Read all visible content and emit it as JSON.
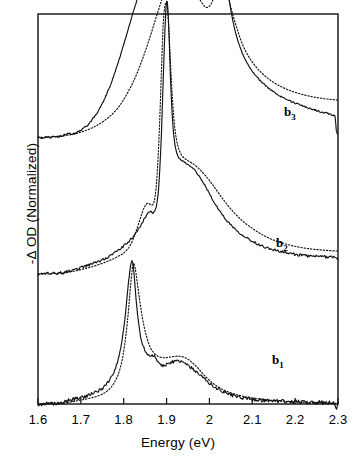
{
  "figure": {
    "axis_label_x": "Energy (eV)",
    "axis_label_y": "-Δ OD (Normalized)",
    "frame": {
      "left": 38,
      "right": 338,
      "top": 14,
      "bottom": 404
    }
  },
  "trace_labels": [
    {
      "name": "b1",
      "base": "b",
      "sub": "1",
      "x": 272,
      "y": 352
    },
    {
      "name": "b2",
      "base": "b",
      "sub": "2",
      "x": 276,
      "y": 235
    },
    {
      "name": "b3",
      "base": "b",
      "sub": "3",
      "x": 284,
      "y": 104
    }
  ],
  "chart_data": {
    "type": "line",
    "title": "",
    "xlabel": "Energy (eV)",
    "ylabel": "-Δ OD (Normalized)",
    "xlim": [
      1.6,
      2.3
    ],
    "ylim": [
      0,
      3
    ],
    "grid": false,
    "legend": null,
    "xticks": [
      1.6,
      1.7,
      1.8,
      1.9,
      2.0,
      2.1,
      2.2,
      2.3
    ],
    "xtick_labels": [
      "1.6",
      "1.7",
      "1.8",
      "1.9",
      "2",
      "2.1",
      "2.2",
      "2.3"
    ],
    "yticks": [],
    "ytick_labels": [],
    "offsets": {
      "b1": 0.0,
      "b2": 1.0,
      "b3": 2.05
    },
    "series": [
      {
        "name": "b1 experimental",
        "label": "b1",
        "style": "solid",
        "noise": 0.012,
        "x": [
          1.6,
          1.62,
          1.64,
          1.655,
          1.665,
          1.675,
          1.685,
          1.695,
          1.705,
          1.715,
          1.725,
          1.735,
          1.745,
          1.755,
          1.765,
          1.775,
          1.785,
          1.793,
          1.8,
          1.806,
          1.811,
          1.815,
          1.818,
          1.82,
          1.822,
          1.825,
          1.829,
          1.834,
          1.84,
          1.847,
          1.855,
          1.862,
          1.868,
          1.872,
          1.876,
          1.88,
          1.886,
          1.893,
          1.9,
          1.908,
          1.916,
          1.924,
          1.932,
          1.94,
          1.948,
          1.956,
          1.964,
          1.972,
          1.98,
          1.99,
          2.0,
          2.015,
          2.03,
          2.05,
          2.07,
          2.09,
          2.11,
          2.13,
          2.15,
          2.17,
          2.19,
          2.21,
          2.23,
          2.25,
          2.27,
          2.285,
          2.29,
          2.295,
          2.3
        ],
        "y": [
          0.0,
          0.0,
          0.0,
          0.005,
          0.018,
          0.03,
          0.038,
          0.046,
          0.055,
          0.064,
          0.075,
          0.09,
          0.11,
          0.138,
          0.175,
          0.23,
          0.32,
          0.43,
          0.58,
          0.76,
          0.93,
          1.04,
          1.09,
          1.1,
          1.07,
          0.96,
          0.8,
          0.64,
          0.51,
          0.43,
          0.382,
          0.368,
          0.372,
          0.37,
          0.352,
          0.322,
          0.3,
          0.296,
          0.305,
          0.318,
          0.326,
          0.33,
          0.326,
          0.316,
          0.3,
          0.282,
          0.262,
          0.24,
          0.218,
          0.188,
          0.16,
          0.126,
          0.1,
          0.072,
          0.054,
          0.042,
          0.034,
          0.028,
          0.024,
          0.02,
          0.018,
          0.016,
          0.014,
          0.012,
          0.01,
          0.008,
          0.005,
          -0.03,
          0.0
        ]
      },
      {
        "name": "b1 fit",
        "label": "b1",
        "style": "dotted",
        "noise": 0.0,
        "x": [
          1.6,
          1.63,
          1.66,
          1.68,
          1.7,
          1.72,
          1.74,
          1.755,
          1.768,
          1.778,
          1.788,
          1.797,
          1.804,
          1.81,
          1.815,
          1.819,
          1.822,
          1.826,
          1.831,
          1.838,
          1.846,
          1.854,
          1.862,
          1.87,
          1.878,
          1.886,
          1.894,
          1.902,
          1.91,
          1.918,
          1.926,
          1.934,
          1.942,
          1.95,
          1.958,
          1.966,
          1.975,
          1.985,
          2.0,
          2.02,
          2.04,
          2.06,
          2.085,
          2.11,
          2.14,
          2.17,
          2.2,
          2.235,
          2.27,
          2.3
        ],
        "y": [
          0.0,
          0.002,
          0.008,
          0.018,
          0.03,
          0.044,
          0.062,
          0.085,
          0.12,
          0.165,
          0.235,
          0.35,
          0.5,
          0.68,
          0.87,
          1.01,
          1.08,
          1.06,
          0.95,
          0.78,
          0.62,
          0.51,
          0.435,
          0.395,
          0.372,
          0.36,
          0.356,
          0.358,
          0.362,
          0.366,
          0.368,
          0.366,
          0.358,
          0.344,
          0.324,
          0.3,
          0.27,
          0.232,
          0.182,
          0.132,
          0.098,
          0.075,
          0.055,
          0.042,
          0.03,
          0.022,
          0.016,
          0.011,
          0.007,
          0.004
        ]
      },
      {
        "name": "b2 experimental",
        "label": "b2",
        "style": "solid",
        "noise": 0.009,
        "x": [
          1.6,
          1.63,
          1.66,
          1.67,
          1.68,
          1.69,
          1.7,
          1.71,
          1.72,
          1.73,
          1.74,
          1.75,
          1.76,
          1.77,
          1.78,
          1.79,
          1.8,
          1.812,
          1.824,
          1.834,
          1.843,
          1.85,
          1.856,
          1.861,
          1.865,
          1.868,
          1.872,
          1.876,
          1.88,
          1.884,
          1.888,
          1.892,
          1.896,
          1.899,
          1.901,
          1.903,
          1.906,
          1.909,
          1.913,
          1.918,
          1.924,
          1.93,
          1.936,
          1.942,
          1.948,
          1.954,
          1.96,
          1.966,
          1.972,
          1.978,
          1.985,
          1.993,
          2.002,
          2.012,
          2.024,
          2.038,
          2.055,
          2.075,
          2.095,
          2.115,
          2.135,
          2.155,
          2.175,
          2.195,
          2.215,
          2.235,
          2.255,
          2.275,
          2.29,
          2.3
        ],
        "y": [
          0.0,
          0.002,
          0.01,
          0.018,
          0.028,
          0.038,
          0.048,
          0.058,
          0.07,
          0.082,
          0.095,
          0.11,
          0.126,
          0.144,
          0.164,
          0.188,
          0.214,
          0.252,
          0.296,
          0.342,
          0.392,
          0.436,
          0.466,
          0.482,
          0.474,
          0.468,
          0.48,
          0.52,
          0.61,
          0.79,
          1.08,
          1.48,
          1.86,
          2.06,
          2.1,
          2.04,
          1.82,
          1.52,
          1.23,
          1.03,
          0.93,
          0.89,
          0.872,
          0.858,
          0.846,
          0.832,
          0.816,
          0.796,
          0.77,
          0.742,
          0.706,
          0.66,
          0.606,
          0.546,
          0.484,
          0.422,
          0.362,
          0.306,
          0.262,
          0.228,
          0.202,
          0.182,
          0.166,
          0.154,
          0.144,
          0.138,
          0.134,
          0.132,
          0.132,
          0.12
        ]
      },
      {
        "name": "b2 fit",
        "label": "b2",
        "style": "dotted",
        "noise": 0.0,
        "x": [
          1.6,
          1.64,
          1.67,
          1.69,
          1.71,
          1.73,
          1.75,
          1.77,
          1.785,
          1.8,
          1.812,
          1.822,
          1.83,
          1.838,
          1.845,
          1.851,
          1.856,
          1.86,
          1.864,
          1.868,
          1.872,
          1.876,
          1.88,
          1.884,
          1.888,
          1.892,
          1.896,
          1.899,
          1.901,
          1.904,
          1.908,
          1.913,
          1.919,
          1.926,
          1.934,
          1.942,
          1.95,
          1.958,
          1.966,
          1.975,
          1.985,
          1.996,
          2.008,
          2.022,
          2.038,
          2.058,
          2.08,
          2.105,
          2.135,
          2.17,
          2.21,
          2.25,
          2.29,
          2.3
        ],
        "y": [
          0.0,
          0.004,
          0.014,
          0.026,
          0.042,
          0.06,
          0.082,
          0.108,
          0.132,
          0.162,
          0.204,
          0.268,
          0.34,
          0.42,
          0.49,
          0.53,
          0.545,
          0.54,
          0.53,
          0.535,
          0.57,
          0.68,
          0.88,
          1.18,
          1.56,
          1.92,
          2.06,
          2.09,
          2.08,
          1.96,
          1.7,
          1.38,
          1.13,
          0.99,
          0.92,
          0.89,
          0.872,
          0.856,
          0.838,
          0.812,
          0.778,
          0.736,
          0.684,
          0.62,
          0.548,
          0.47,
          0.4,
          0.34,
          0.282,
          0.238,
          0.206,
          0.188,
          0.178,
          0.176
        ]
      },
      {
        "name": "b3 experimental",
        "label": "b3",
        "style": "solid",
        "noise": 0.006,
        "x": [
          1.6,
          1.63,
          1.655,
          1.665,
          1.672,
          1.678,
          1.684,
          1.69,
          1.698,
          1.706,
          1.715,
          1.724,
          1.733,
          1.742,
          1.751,
          1.76,
          1.769,
          1.778,
          1.787,
          1.796,
          1.805,
          1.814,
          1.823,
          1.832,
          1.841,
          1.85,
          1.859,
          1.868,
          1.877,
          1.886,
          1.895,
          1.903,
          1.911,
          1.919,
          1.927,
          1.935,
          1.943,
          1.951,
          1.959,
          1.967,
          1.975,
          1.983,
          1.99,
          1.996,
          2.002,
          2.008,
          2.013,
          2.018,
          2.022,
          2.026,
          2.03,
          2.034,
          2.038,
          2.043,
          2.049,
          2.056,
          2.064,
          2.073,
          2.083,
          2.094,
          2.106,
          2.119,
          2.133,
          2.148,
          2.164,
          2.181,
          2.199,
          2.218,
          2.238,
          2.258,
          2.278,
          2.29,
          2.293,
          2.296,
          2.3
        ],
        "y": [
          0.0,
          0.002,
          0.012,
          0.022,
          0.028,
          0.026,
          0.03,
          0.038,
          0.052,
          0.07,
          0.095,
          0.126,
          0.165,
          0.212,
          0.268,
          0.332,
          0.404,
          0.486,
          0.576,
          0.672,
          0.772,
          0.874,
          0.974,
          1.068,
          1.152,
          1.224,
          1.284,
          1.332,
          1.368,
          1.392,
          1.402,
          1.398,
          1.384,
          1.368,
          1.356,
          1.35,
          1.34,
          1.32,
          1.288,
          1.25,
          1.216,
          1.196,
          1.192,
          1.204,
          1.236,
          1.292,
          1.366,
          1.444,
          1.496,
          1.512,
          1.482,
          1.4,
          1.28,
          1.14,
          1.0,
          0.876,
          0.77,
          0.68,
          0.604,
          0.54,
          0.484,
          0.436,
          0.394,
          0.356,
          0.322,
          0.292,
          0.266,
          0.242,
          0.22,
          0.2,
          0.182,
          0.17,
          0.166,
          0.06,
          0.03
        ]
      },
      {
        "name": "b3 fit",
        "label": "b3",
        "style": "dotted",
        "noise": 0.0,
        "x": [
          1.6,
          1.64,
          1.67,
          1.69,
          1.71,
          1.73,
          1.75,
          1.77,
          1.785,
          1.8,
          1.815,
          1.828,
          1.84,
          1.852,
          1.863,
          1.873,
          1.882,
          1.89,
          1.898,
          1.906,
          1.914,
          1.922,
          1.93,
          1.938,
          1.946,
          1.954,
          1.962,
          1.97,
          1.978,
          1.986,
          1.993,
          2.0,
          2.007,
          2.013,
          2.019,
          2.025,
          2.031,
          2.038,
          2.046,
          2.055,
          2.066,
          2.078,
          2.092,
          2.108,
          2.126,
          2.146,
          2.168,
          2.192,
          2.218,
          2.246,
          2.275,
          2.3
        ],
        "y": [
          0.0,
          0.006,
          0.018,
          0.032,
          0.052,
          0.08,
          0.118,
          0.17,
          0.222,
          0.292,
          0.38,
          0.47,
          0.57,
          0.68,
          0.79,
          0.896,
          0.99,
          1.07,
          1.14,
          1.2,
          1.25,
          1.29,
          1.32,
          1.33,
          1.31,
          1.26,
          1.19,
          1.12,
          1.06,
          1.02,
          1.0,
          1.01,
          1.05,
          1.11,
          1.17,
          1.2,
          1.19,
          1.14,
          1.05,
          0.94,
          0.82,
          0.71,
          0.62,
          0.546,
          0.484,
          0.432,
          0.39,
          0.356,
          0.33,
          0.31,
          0.296,
          0.288
        ]
      }
    ]
  }
}
